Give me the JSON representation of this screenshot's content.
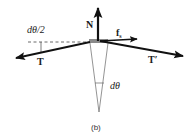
{
  "diagram": {
    "caption": "(b)",
    "colors": {
      "arrow": "#111111",
      "block": "#8a8a8a",
      "thin_line": "#555555",
      "dashed": "#444444"
    },
    "forces": {
      "normal": {
        "label": "N"
      },
      "friction": {
        "label": "f",
        "subscript": "s"
      },
      "tension_left": {
        "label": "T"
      },
      "tension_right": {
        "label": "T′"
      }
    },
    "angles": {
      "half_angle": "dθ/2",
      "full_angle": "dθ"
    }
  }
}
